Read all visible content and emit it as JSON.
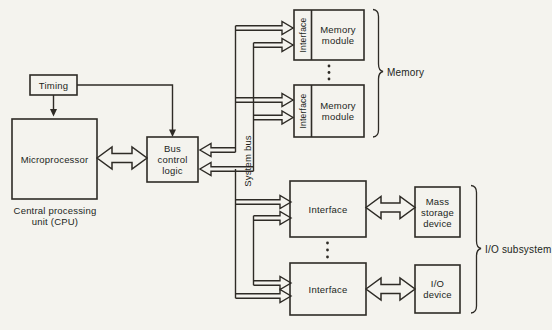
{
  "diagram": {
    "title_hint": "CPU / system-bus block diagram",
    "colors": {
      "background": "#f4f3ee",
      "line": "#2e2b26",
      "text": "#221f1b"
    },
    "boxes": {
      "timing": {
        "label": "Timing"
      },
      "microprocessor": {
        "label": "Microprocessor"
      },
      "cpu_caption": "Central processing\nunit (CPU)",
      "bus_control": {
        "label": "Bus\ncontrol\nlogic"
      },
      "memory_module_1": {
        "interface_label": "Interface",
        "label": "Memory\nmodule"
      },
      "memory_module_2": {
        "interface_label": "Interface",
        "label": "Memory\nmodule"
      },
      "io_interface_1": {
        "label": "Interface"
      },
      "io_interface_2": {
        "label": "Interface"
      },
      "mass_storage": {
        "label": "Mass\nstorage\ndevice"
      },
      "io_device": {
        "label": "I/O\ndevice"
      }
    },
    "bus_label": "System bus",
    "groups": {
      "memory": {
        "label": "Memory"
      },
      "io": {
        "label": "I/O subsystem"
      }
    }
  }
}
